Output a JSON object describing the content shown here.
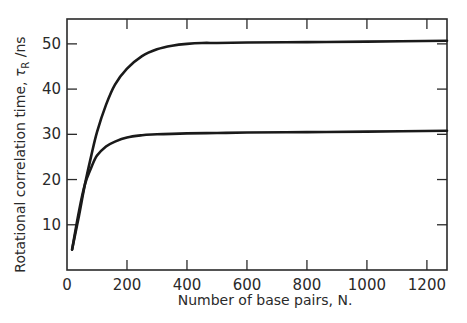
{
  "chart_data": {
    "type": "line",
    "title": "",
    "xlabel": "Number of base pairs, N.",
    "ylabel": "Rotational correlation time, τR /ns",
    "ylabel_parts": {
      "prefix": "Rotational correlation time, ",
      "symbol": "τ",
      "subscript": "R",
      "suffix": " /ns"
    },
    "xlim": [
      0,
      1267
    ],
    "ylim": [
      0,
      55.5
    ],
    "xticks": [
      0,
      200,
      400,
      600,
      800,
      1000,
      1200
    ],
    "xtick_labels": [
      "0",
      "200",
      "400",
      "600",
      "800",
      "1000",
      "1200"
    ],
    "yticks": [
      10,
      20,
      30,
      40,
      50
    ],
    "ytick_labels": [
      "10",
      "20",
      "30",
      "40",
      "50"
    ],
    "grid": false,
    "legend": null,
    "series": [
      {
        "name": "upper curve",
        "x": [
          17,
          40,
          60,
          80,
          100,
          130,
          160,
          200,
          250,
          300,
          350,
          400,
          450,
          500,
          600,
          800,
          1000,
          1267
        ],
        "y": [
          4.5,
          12,
          19,
          25,
          30.5,
          36.5,
          41,
          44.5,
          47.3,
          48.8,
          49.6,
          50.0,
          50.2,
          50.2,
          50.3,
          50.4,
          50.5,
          50.7
        ]
      },
      {
        "name": "lower curve",
        "x": [
          17,
          40,
          60,
          80,
          100,
          130,
          160,
          200,
          250,
          300,
          350,
          400,
          500,
          600,
          800,
          1000,
          1267
        ],
        "y": [
          4.5,
          13,
          19,
          22.5,
          25.3,
          27.3,
          28.4,
          29.3,
          29.8,
          30.0,
          30.1,
          30.2,
          30.3,
          30.4,
          30.5,
          30.6,
          30.8
        ]
      }
    ]
  },
  "colors": {
    "line": "#1a1a1a",
    "axis": "#2a2a2a",
    "background": "#ffffff"
  }
}
